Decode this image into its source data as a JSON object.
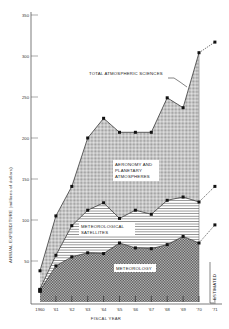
{
  "chart_data": {
    "type": "area",
    "stacked": true,
    "title": "",
    "xlabel": "FISCAL YEAR",
    "ylabel": "ANNUAL EXPENDITURE (millions of dollars)",
    "ylim": [
      0,
      350
    ],
    "yticks": [
      50,
      100,
      150,
      200,
      250,
      300,
      350
    ],
    "x": [
      "1960",
      "'61",
      "'62",
      "'63",
      "'64",
      "'65",
      "'66",
      "'67",
      "'68",
      "'69",
      "'70",
      "'71"
    ],
    "estimated_from_index": 10,
    "estimated_label": "ESTIMATED",
    "grid": false,
    "series": [
      {
        "name": "METEOROLOGY",
        "cumulative_values": [
          14,
          44,
          55,
          60,
          59,
          72,
          66,
          65,
          70,
          80,
          72,
          94
        ],
        "pattern": "dense-checker"
      },
      {
        "name": "METEOROLOGICAL SATELLITES",
        "cumulative_values": [
          16,
          57,
          93,
          112,
          121,
          102,
          112,
          107,
          124,
          128,
          122,
          141
        ],
        "pattern": "horizontal-lines"
      },
      {
        "name": "AERONOMY AND PLANETARY ATMOSPHERES",
        "cumulative_values": [
          38,
          105,
          141,
          200,
          224,
          207,
          207,
          207,
          249,
          237,
          304,
          317
        ],
        "pattern": "light-stipple"
      }
    ],
    "total_label": "TOTAL ATMOSPHERIC SCIENCES",
    "annotations": [
      {
        "text": "TOTAL ATMOSPHERIC SCIENCES",
        "points_to": "total line near '69-'70"
      },
      {
        "text": "AERONOMY AND PLANETARY ATMOSPHERES",
        "region": "top band"
      },
      {
        "text": "METEOROLOGICAL SATELLITES",
        "region": "middle band"
      },
      {
        "text": "METEOROLOGY",
        "region": "bottom band"
      },
      {
        "text": "ESTIMATED",
        "region": "'70-'71 dashed extension"
      }
    ]
  },
  "labels": {
    "total": "TOTAL ATMOSPHERIC SCIENCES",
    "aeronomy_1": "AERONOMY AND",
    "aeronomy_2": "PLANETARY",
    "aeronomy_3": "ATMOSPHERES",
    "satellites_1": "METEOROLOGICAL",
    "satellites_2": "SATELLITES",
    "meteorology": "METEOROLOGY",
    "estimated": "ESTIMATED",
    "xlabel": "FISCAL YEAR",
    "ylabel": "ANNUAL EXPENDITURE (millions of dollars)"
  },
  "yticks": [
    "350",
    "300",
    "250",
    "200",
    "150",
    "100",
    "50"
  ],
  "xticks": [
    "1960",
    "'61",
    "'62",
    "'63",
    "'64",
    "'65",
    "'66",
    "'67",
    "'68",
    "'69",
    "'70",
    "'71"
  ]
}
